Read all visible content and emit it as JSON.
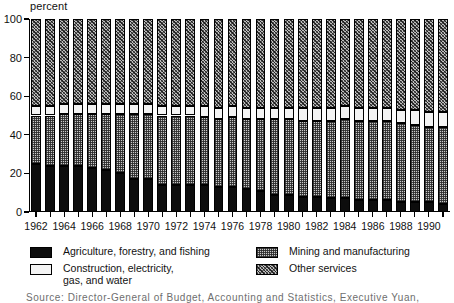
{
  "chart_data": {
    "type": "bar",
    "subtype": "stacked-100-percent",
    "title": "",
    "ylabel": "percent",
    "xlabel": "",
    "ylim": [
      0,
      100
    ],
    "yticks": [
      0,
      20,
      40,
      60,
      80,
      100
    ],
    "grid": false,
    "legend_position": "below",
    "categories": [
      "1962",
      "1963",
      "1964",
      "1965",
      "1966",
      "1967",
      "1968",
      "1969",
      "1970",
      "1971",
      "1972",
      "1973",
      "1974",
      "1975",
      "1976",
      "1977",
      "1978",
      "1979",
      "1980",
      "1981",
      "1982",
      "1983",
      "1984",
      "1985",
      "1986",
      "1987",
      "1988",
      "1989",
      "1990",
      "1991"
    ],
    "tick_labels": [
      "1962",
      "",
      "1964",
      "",
      "1966",
      "",
      "1968",
      "",
      "1970",
      "",
      "1972",
      "",
      "1974",
      "",
      "1976",
      "",
      "1978",
      "",
      "1980",
      "",
      "1982",
      "",
      "1984",
      "",
      "1986",
      "",
      "1988",
      "",
      "1990",
      ""
    ],
    "series": [
      {
        "name": "Agriculture, forestry, and fishing",
        "pattern": "solid-black",
        "color": "#0d0d0d",
        "values": [
          25,
          24,
          24,
          24,
          23,
          22,
          20,
          17,
          17,
          14,
          14,
          14,
          14,
          13,
          13,
          12,
          11,
          9,
          9,
          8,
          8,
          7,
          7,
          6,
          6,
          6,
          5,
          5,
          5,
          4
        ]
      },
      {
        "name": "Mining and manufacturing",
        "pattern": "fine-checker",
        "color": "#c9c9c9",
        "values": [
          25,
          26,
          27,
          27,
          28,
          29,
          31,
          34,
          34,
          36,
          36,
          36,
          35,
          35,
          36,
          36,
          37,
          39,
          39,
          39,
          39,
          40,
          41,
          41,
          41,
          41,
          41,
          40,
          39,
          40
        ]
      },
      {
        "name": "Construction, electricity, gas, and water",
        "pattern": "white",
        "color": "#f4f4f4",
        "values": [
          5,
          5,
          5,
          5,
          5,
          5,
          5,
          5,
          5,
          5,
          5,
          5,
          6,
          6,
          6,
          6,
          6,
          6,
          6,
          7,
          7,
          7,
          7,
          7,
          7,
          7,
          7,
          8,
          8,
          8
        ]
      },
      {
        "name": "Other services",
        "pattern": "diagonal-hatch",
        "color": "#bdbdbd",
        "values": [
          45,
          45,
          44,
          44,
          44,
          44,
          44,
          44,
          44,
          45,
          45,
          45,
          45,
          46,
          45,
          46,
          46,
          46,
          46,
          46,
          46,
          46,
          45,
          46,
          46,
          46,
          47,
          47,
          48,
          48
        ]
      }
    ]
  },
  "legend": {
    "items": [
      {
        "label_line1": "Agriculture, forestry, and fishing",
        "label_line2": "",
        "swatch": "solid-black"
      },
      {
        "label_line1": "Construction, electricity,",
        "label_line2": "gas, and water",
        "swatch": "white"
      },
      {
        "label_line1": "Mining and manufacturing",
        "label_line2": "",
        "swatch": "fine-checker"
      },
      {
        "label_line1": "Other services",
        "label_line2": "",
        "swatch": "diagonal-hatch"
      }
    ]
  },
  "source": {
    "text": "Source:  Director-General  of  Budget,  Accounting  and  Statistics,  Executive  Yuan,"
  }
}
